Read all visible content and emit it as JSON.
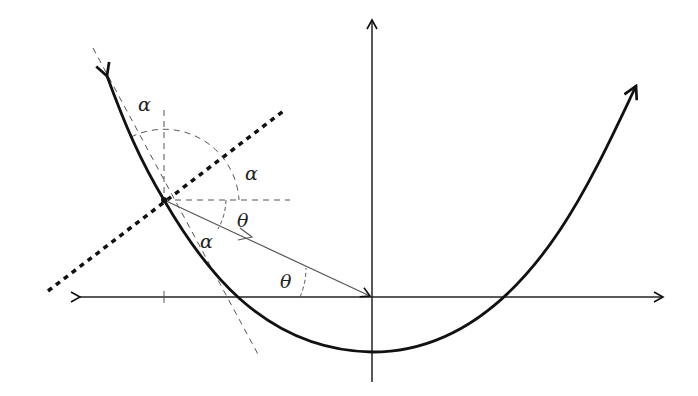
{
  "diagram": {
    "colors": {
      "background": "#ffffff",
      "ink": "#111111",
      "thin": "#555555"
    },
    "axes": {
      "origin": [
        372,
        297
      ],
      "x_axis": {
        "from": [
          78,
          297
        ],
        "to": [
          665,
          297
        ],
        "arrows": "both"
      },
      "y_axis": {
        "from": [
          372,
          382
        ],
        "to": [
          372,
          18
        ],
        "arrows": "top"
      }
    },
    "parabola": {
      "vertex": [
        372,
        352
      ],
      "left_tip": [
        107,
        75
      ],
      "right_tip": [
        636,
        85
      ],
      "arrows": "both"
    },
    "point_P": [
      163,
      200
    ],
    "labels": {
      "alpha_top": "α",
      "alpha_right": "α",
      "alpha_lower": "α",
      "theta_mid": "θ",
      "theta_origin": "θ"
    }
  }
}
